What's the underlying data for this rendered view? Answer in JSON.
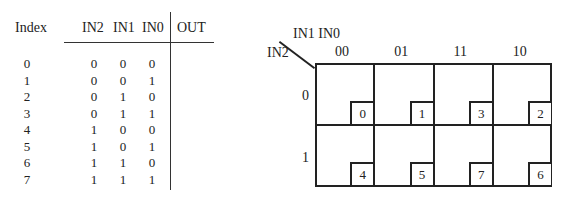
{
  "truth_table": {
    "headers": {
      "index": "Index",
      "in2": "IN2",
      "in1": "IN1",
      "in0": "IN0",
      "out": "OUT"
    },
    "rows": [
      {
        "index": "0",
        "in2": "0",
        "in1": "0",
        "in0": "0"
      },
      {
        "index": "1",
        "in2": "0",
        "in1": "0",
        "in0": "1"
      },
      {
        "index": "2",
        "in2": "0",
        "in1": "1",
        "in0": "0"
      },
      {
        "index": "3",
        "in2": "0",
        "in1": "1",
        "in0": "1"
      },
      {
        "index": "4",
        "in2": "1",
        "in1": "0",
        "in0": "0"
      },
      {
        "index": "5",
        "in2": "1",
        "in1": "0",
        "in0": "1"
      },
      {
        "index": "6",
        "in2": "1",
        "in1": "1",
        "in0": "0"
      },
      {
        "index": "7",
        "in2": "1",
        "in1": "1",
        "in0": "1"
      }
    ]
  },
  "kmap": {
    "col_var_label": "IN1 IN0",
    "row_var_label": "IN2",
    "col_labels": [
      "00",
      "01",
      "11",
      "10"
    ],
    "row_labels": [
      "0",
      "1"
    ],
    "minterms": [
      [
        "0",
        "1",
        "3",
        "2"
      ],
      [
        "4",
        "5",
        "7",
        "6"
      ]
    ]
  }
}
